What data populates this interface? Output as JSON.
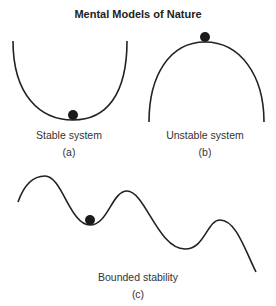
{
  "title": "Mental Models of Nature",
  "panels": [
    {
      "id": "a",
      "caption": "Stable system",
      "letter": "(a)",
      "shape": "valley",
      "ball": "bottom"
    },
    {
      "id": "b",
      "caption": "Unstable system",
      "letter": "(b)",
      "shape": "hill",
      "ball": "top"
    },
    {
      "id": "c",
      "caption": "Bounded stability",
      "letter": "(c)",
      "shape": "wave",
      "ball": "local-trough"
    }
  ],
  "colors": {
    "line": "#222222",
    "ball": "#1a1a1a"
  }
}
